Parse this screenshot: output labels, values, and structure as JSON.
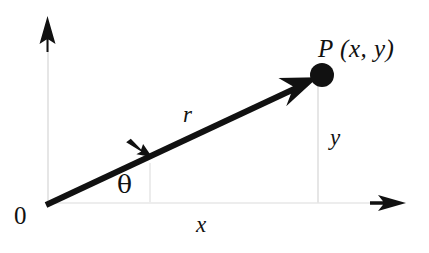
{
  "figure": {
    "type": "polar-coordinates-diagram",
    "background_color": "#ffffff",
    "ink_color": "#111111",
    "axis_color": "#e3e3e3",
    "width": 429,
    "height": 253
  },
  "labels": {
    "origin": "0",
    "point": "P (x, y)",
    "radius": "r",
    "angle": "θ",
    "x_component": "x",
    "y_component": "y"
  },
  "icons": {
    "y_axis_arrow": "arrow-up-icon",
    "x_axis_arrow": "arrow-right-icon",
    "radius_arrow": "arrow-upright-icon",
    "angle_arrow": "arrow-upright-small-icon",
    "point_marker": "filled-circle-icon"
  },
  "geometry": {
    "origin": {
      "x": 48,
      "y": 203
    },
    "point_P": {
      "x": 322,
      "y": 75
    },
    "y_axis_top": {
      "x": 48,
      "y": 18
    },
    "x_axis_right": {
      "x": 404,
      "y": 203
    },
    "drop_line_foot": {
      "x": 318,
      "y": 203
    },
    "angle_arrow_tip": {
      "x": 152,
      "y": 158
    },
    "angle_arrow_base": {
      "x": 150,
      "y": 200
    }
  }
}
